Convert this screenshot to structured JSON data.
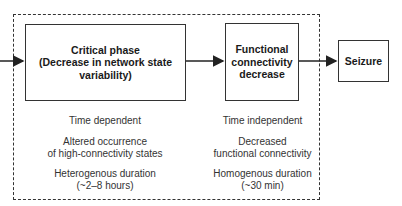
{
  "diagram": {
    "boxes": [
      {
        "id": "critical-phase",
        "line1": "Critical phase",
        "line2": "(Decrease in network state",
        "line3": "variability)"
      },
      {
        "id": "functional-connectivity-decrease",
        "line1": "Functional",
        "line2": "connectivity",
        "line3": "decrease"
      },
      {
        "id": "seizure",
        "line1": "Seizure"
      }
    ],
    "notes_left": [
      {
        "line1": "Time dependent"
      },
      {
        "line1": "Altered occurrence",
        "line2": "of high-connectivity states"
      },
      {
        "line1": "Heterogenous duration",
        "line2": "(~2–8 hours)"
      }
    ],
    "notes_right": [
      {
        "line1": "Time independent"
      },
      {
        "line1": "Decreased",
        "line2": "functional connectivity"
      },
      {
        "line1": "Homogenous duration",
        "line2": "(~30 min)"
      }
    ],
    "colors": {
      "stroke": "#333333",
      "background": "#ffffff"
    }
  }
}
